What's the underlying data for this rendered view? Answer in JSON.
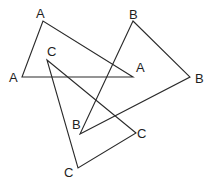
{
  "diagram": {
    "stroke_color": "#2a2a2a",
    "label_color": "#1e1e1e",
    "triangles": [
      {
        "name": "A",
        "vertices": [
          [
            43,
            21
          ],
          [
            22,
            77
          ],
          [
            133,
            77
          ]
        ],
        "labels": [
          {
            "text": "A",
            "x": 36,
            "y": 18
          },
          {
            "text": "A",
            "x": 9,
            "y": 82
          },
          {
            "text": "A",
            "x": 136,
            "y": 72
          }
        ]
      },
      {
        "name": "B",
        "vertices": [
          [
            133,
            21
          ],
          [
            190,
            77
          ],
          [
            80,
            134
          ]
        ],
        "labels": [
          {
            "text": "B",
            "x": 129,
            "y": 19
          },
          {
            "text": "B",
            "x": 195,
            "y": 83
          },
          {
            "text": "B",
            "x": 72,
            "y": 129
          }
        ]
      },
      {
        "name": "C",
        "vertices": [
          [
            47,
            60
          ],
          [
            136,
            133
          ],
          [
            78,
            168
          ]
        ],
        "labels": [
          {
            "text": "C",
            "x": 47,
            "y": 56
          },
          {
            "text": "C",
            "x": 137,
            "y": 138
          },
          {
            "text": "C",
            "x": 64,
            "y": 177
          }
        ]
      }
    ]
  }
}
